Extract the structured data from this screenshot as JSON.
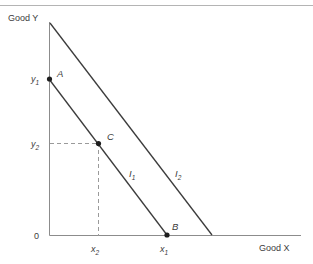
{
  "figure": {
    "axes": {
      "y_axis_label": "Good Y",
      "x_axis_label": "Good X",
      "origin_label": "0"
    },
    "tick_labels": {
      "y1": "y",
      "y1_sub": "1",
      "y2": "y",
      "y2_sub": "2",
      "x1": "x",
      "x1_sub": "1",
      "x2": "x",
      "x2_sub": "2"
    },
    "points": [
      {
        "label": "A",
        "x": 49,
        "y": 79
      },
      {
        "label": "C",
        "x": 98,
        "y": 143
      },
      {
        "label": "B",
        "x": 167,
        "y": 235
      }
    ],
    "point_labels": {
      "a": "A",
      "b": "B",
      "c": "C"
    },
    "curves": [
      {
        "label": "I",
        "sub": "1",
        "x1": 49,
        "y1": 79,
        "x2": 167,
        "y2": 235
      },
      {
        "label": "I",
        "sub": "2",
        "x1": 50,
        "y1": 23,
        "x2": 212,
        "y2": 235
      }
    ],
    "curve_labels": {
      "i1": "I",
      "i1_sub": "1",
      "i2": "I",
      "i2_sub": "2"
    },
    "colors": {
      "line": "#3c3c3c",
      "axis": "#8c8c8c",
      "dashed": "#9a9a9a",
      "text": "#3c3c3c",
      "top_rule": "#b4b4b4",
      "background": "#ffffff"
    }
  }
}
